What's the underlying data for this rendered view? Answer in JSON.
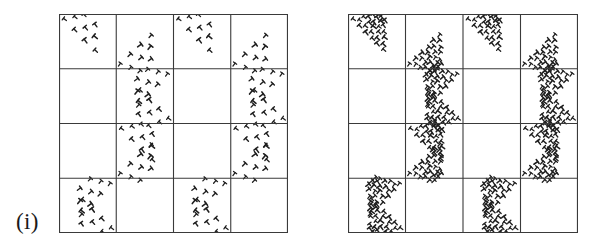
{
  "figure": {
    "type": "diagram",
    "background_color": "#ffffff",
    "line_color": "#3a3a3a",
    "mark_color": "#1f1f1f",
    "panel_count": 2
  },
  "panels": [
    {
      "id": "i",
      "label": "(i)",
      "grid": {
        "rows": 4,
        "cols": 4,
        "x": 59,
        "y": 14,
        "width": 229,
        "height": 219,
        "line_width": 1.1
      },
      "motif": {
        "name": "sparse-triangular-tally-cluster",
        "rows_of_marks": 3,
        "orientation": "anti-diagonal",
        "marks_per_motif": 6,
        "glyph": "T"
      },
      "motif_cells": [
        {
          "row": 0,
          "col": 0,
          "corner": "top-left"
        },
        {
          "row": 0,
          "col": 2,
          "corner": "top-left"
        },
        {
          "row": 0,
          "col": 1,
          "corner": "bottom-left"
        },
        {
          "row": 0,
          "col": 3,
          "corner": "bottom-left"
        },
        {
          "row": 1,
          "col": 1,
          "corner": "top-right"
        },
        {
          "row": 1,
          "col": 3,
          "corner": "top-right"
        },
        {
          "row": 1,
          "col": 1,
          "corner": "bottom-right"
        },
        {
          "row": 1,
          "col": 3,
          "corner": "bottom-right"
        },
        {
          "row": 2,
          "col": 1,
          "corner": "top-left"
        },
        {
          "row": 2,
          "col": 3,
          "corner": "top-left"
        },
        {
          "row": 2,
          "col": 1,
          "corner": "bottom-left"
        },
        {
          "row": 2,
          "col": 3,
          "corner": "bottom-left"
        },
        {
          "row": 3,
          "col": 0,
          "corner": "top-right"
        },
        {
          "row": 3,
          "col": 2,
          "corner": "top-right"
        },
        {
          "row": 3,
          "col": 0,
          "corner": "bottom-right"
        },
        {
          "row": 3,
          "col": 2,
          "corner": "bottom-right"
        }
      ]
    },
    {
      "id": "ii",
      "label": "(ii)",
      "grid": {
        "rows": 4,
        "cols": 4,
        "x": 44,
        "y": 14,
        "width": 230,
        "height": 219,
        "line_width": 1.1
      },
      "motif": {
        "name": "dense-triangular-tally-cluster",
        "rows_of_marks": 3,
        "orientation": "anti-diagonal",
        "marks_per_motif": 14,
        "glyph": "T"
      },
      "motif_cells": [
        {
          "row": 0,
          "col": 0,
          "corner": "top-left"
        },
        {
          "row": 0,
          "col": 2,
          "corner": "top-left"
        },
        {
          "row": 0,
          "col": 1,
          "corner": "bottom-left"
        },
        {
          "row": 0,
          "col": 3,
          "corner": "bottom-left"
        },
        {
          "row": 1,
          "col": 1,
          "corner": "top-right"
        },
        {
          "row": 1,
          "col": 3,
          "corner": "top-right"
        },
        {
          "row": 1,
          "col": 1,
          "corner": "bottom-right"
        },
        {
          "row": 1,
          "col": 3,
          "corner": "bottom-right"
        },
        {
          "row": 2,
          "col": 1,
          "corner": "top-left"
        },
        {
          "row": 2,
          "col": 3,
          "corner": "top-left"
        },
        {
          "row": 2,
          "col": 1,
          "corner": "bottom-left"
        },
        {
          "row": 2,
          "col": 3,
          "corner": "bottom-left"
        },
        {
          "row": 3,
          "col": 0,
          "corner": "top-right"
        },
        {
          "row": 3,
          "col": 2,
          "corner": "top-right"
        },
        {
          "row": 3,
          "col": 0,
          "corner": "bottom-right"
        },
        {
          "row": 3,
          "col": 2,
          "corner": "bottom-right"
        }
      ]
    }
  ]
}
